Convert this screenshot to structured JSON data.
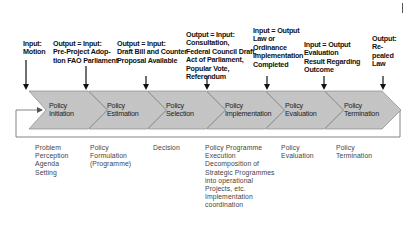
{
  "diagram": {
    "type": "policy-cycle-chevron-flow",
    "colors": {
      "chevron_fill": "#c4c4c4",
      "chevron_stroke": "#888888",
      "line": "#555555",
      "arrow": "#111111"
    },
    "inputs": [
      {
        "id": "in1",
        "text": "Input:\nMotion"
      },
      {
        "id": "in2",
        "text": "Output = Input:\nPre-Project Adop-\ntion FAO Parliament"
      },
      {
        "id": "in3",
        "text": "Output = Input:\nDraft Bill and Counter\nProposal Available"
      },
      {
        "id": "in4",
        "text": "Output = Input:\nConsultation,\nFederal Council Draft,\nAct of Parliament,\nPopular Vote,\nReferendum"
      },
      {
        "id": "in5",
        "text": "Input = Output\nLaw or\nOrdinance\nImplementation\nCompleted"
      },
      {
        "id": "in6",
        "text": "Input = Output\nEvaluation\nResult Regarding\nOutcome"
      },
      {
        "id": "in7",
        "text": "Output:\nRe-\npealed\nLaw"
      }
    ],
    "stages": [
      {
        "id": "s1",
        "label": "Policy\nInitiation"
      },
      {
        "id": "s2",
        "label": "Policy\nEstimation"
      },
      {
        "id": "s3",
        "label": "Policy\nSelection"
      },
      {
        "id": "s4",
        "label": "Policy\nImplementation"
      },
      {
        "id": "s5",
        "label": "Policy\nEvaluation"
      },
      {
        "id": "s6",
        "label": "Policy\nTermination"
      }
    ],
    "activities": [
      {
        "id": "a1",
        "text": "Problem\nPerception\nAgenda\nSetting"
      },
      {
        "id": "a2",
        "text": "Policy\nFormulation\n(Programme)"
      },
      {
        "id": "a3",
        "text": "Decision"
      },
      {
        "id": "a4",
        "text": "Policy Programme\nExecution\nDecomposition of\nStrategic Programmes\ninto operational\nProjects, etc.\nImplementation\ncoordination"
      },
      {
        "id": "a5",
        "text": "Policy\nEvaluation"
      },
      {
        "id": "a6",
        "text": "Policy\nTermination"
      }
    ]
  }
}
